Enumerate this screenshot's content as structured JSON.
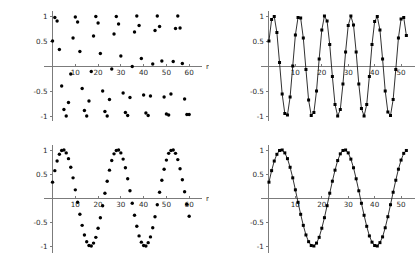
{
  "figure": {
    "name": "sampled-sinusoid-panels",
    "background_color": "#ffffff",
    "axis_color": "#7b7b7b",
    "marker_color": "#000000",
    "line_color": "#1a1a1a",
    "panel_count": 4
  },
  "chart_data": [
    {
      "id": "top-left",
      "type": "scatter",
      "title": "",
      "xlabel": "n",
      "ylabel": "",
      "xlim": [
        -2,
        63
      ],
      "ylim": [
        -1.05,
        1.05
      ],
      "grid": false,
      "legend": null,
      "xticks": [
        10,
        20,
        30,
        40,
        50,
        60
      ],
      "xticklabels": [
        "10",
        "20",
        "30",
        "40",
        "50",
        "60"
      ],
      "yticks": [
        1,
        0.5,
        -0.5,
        -1
      ],
      "yticklabels": [
        "1",
        "0.5",
        "-0.5",
        "-1"
      ],
      "series": [
        {
          "name": "x1[n]",
          "marker": "dot",
          "connected": false,
          "x": [
            0,
            1,
            2,
            3,
            4,
            5,
            6,
            7,
            8,
            9,
            10,
            11,
            12,
            13,
            14,
            15,
            16,
            17,
            18,
            19,
            20,
            21,
            22,
            23,
            24,
            25,
            26,
            27,
            28,
            29,
            30,
            31,
            32,
            33,
            34,
            35,
            36,
            37,
            38,
            39,
            40,
            41,
            42,
            43,
            44,
            45,
            46,
            47,
            48,
            49,
            50,
            51,
            52,
            53,
            54,
            55,
            56,
            57,
            58,
            59,
            60
          ],
          "y": [
            0.5,
            0.97,
            0.9,
            0.33,
            -0.4,
            -0.87,
            -1.0,
            -0.73,
            -0.16,
            0.56,
            0.98,
            0.88,
            0.29,
            -0.45,
            -0.89,
            -1.0,
            -0.7,
            -0.11,
            0.6,
            0.99,
            0.86,
            0.25,
            -0.5,
            -0.91,
            -1.0,
            -0.67,
            -0.06,
            0.64,
            0.99,
            0.84,
            0.2,
            -0.54,
            -0.93,
            -0.99,
            -0.63,
            -0.01,
            0.68,
            1.0,
            0.81,
            0.15,
            -0.58,
            -0.94,
            -0.99,
            -0.6,
            0.04,
            0.71,
            1.0,
            0.79,
            0.1,
            -0.62,
            -0.96,
            -0.98,
            -0.56,
            0.09,
            0.75,
            1.0,
            0.76,
            0.05,
            -0.66,
            -0.97,
            -0.97
          ]
        }
      ]
    },
    {
      "id": "top-right",
      "type": "line",
      "title": "",
      "xlabel": "",
      "ylabel": "",
      "xlim": [
        -1.5,
        53
      ],
      "ylim": [
        -1.05,
        1.05
      ],
      "grid": false,
      "legend": null,
      "xticks": [
        10,
        20,
        30,
        40,
        50
      ],
      "xticklabels": [
        "10",
        "20",
        "30",
        "40",
        "50"
      ],
      "yticks": [
        1,
        0.5,
        -0.5,
        -1
      ],
      "yticklabels": [
        "1",
        "0.5",
        "-0.5",
        "-1"
      ],
      "series": [
        {
          "name": "x2[n]",
          "marker": "square",
          "connected": true,
          "x": [
            0,
            1,
            2,
            3,
            4,
            5,
            6,
            7,
            8,
            9,
            10,
            11,
            12,
            13,
            14,
            15,
            16,
            17,
            18,
            19,
            20,
            21,
            22,
            23,
            24,
            25,
            26,
            27,
            28,
            29,
            30,
            31,
            32,
            33,
            34,
            35,
            36,
            37,
            38,
            39,
            40,
            41,
            42,
            43,
            44,
            45,
            46,
            47,
            48,
            49,
            50,
            51,
            52
          ],
          "y": [
            0.5,
            0.93,
            0.99,
            0.67,
            0.07,
            -0.56,
            -0.95,
            -0.98,
            -0.62,
            0.0,
            0.62,
            0.97,
            0.96,
            0.56,
            -0.07,
            -0.68,
            -0.99,
            -0.93,
            -0.5,
            0.14,
            0.72,
            1.0,
            0.9,
            0.43,
            -0.21,
            -0.77,
            -1.0,
            -0.87,
            -0.36,
            0.28,
            0.81,
            1.0,
            0.82,
            0.28,
            -0.36,
            -0.85,
            -1.0,
            -0.77,
            -0.21,
            0.43,
            0.89,
            0.99,
            0.72,
            0.14,
            -0.5,
            -0.92,
            -0.99,
            -0.67,
            -0.07,
            0.56,
            0.94,
            0.97,
            0.61
          ]
        }
      ]
    },
    {
      "id": "bottom-left",
      "type": "scatter",
      "title": "",
      "xlabel": "n",
      "ylabel": "",
      "xlim": [
        -2,
        63
      ],
      "ylim": [
        -1.05,
        1.05
      ],
      "grid": false,
      "legend": null,
      "xticks": [
        10,
        20,
        30,
        40,
        50,
        60
      ],
      "xticklabels": [
        "10",
        "20",
        "30",
        "40",
        "50",
        "60"
      ],
      "yticks": [
        1,
        0.5,
        -0.5,
        -1
      ],
      "yticklabels": [
        "1",
        "0.5",
        "-0.5",
        "-1"
      ],
      "series": [
        {
          "name": "x3[n]",
          "marker": "dot",
          "connected": false,
          "x": [
            0,
            1,
            2,
            3,
            4,
            5,
            6,
            7,
            8,
            9,
            10,
            11,
            12,
            13,
            14,
            15,
            16,
            17,
            18,
            19,
            20,
            21,
            22,
            23,
            24,
            25,
            26,
            27,
            28,
            29,
            30,
            31,
            32,
            33,
            34,
            35,
            36,
            37,
            38,
            39,
            40,
            41,
            42,
            43,
            44,
            45,
            46,
            47,
            48,
            49,
            50,
            51,
            52,
            53,
            54,
            55,
            56,
            57,
            58,
            59,
            60
          ],
          "y": [
            0.33,
            0.57,
            0.77,
            0.91,
            0.99,
            1.0,
            0.94,
            0.82,
            0.64,
            0.42,
            0.17,
            -0.09,
            -0.34,
            -0.57,
            -0.77,
            -0.91,
            -0.99,
            -1.0,
            -0.94,
            -0.82,
            -0.63,
            -0.41,
            -0.16,
            0.1,
            0.35,
            0.58,
            0.78,
            0.92,
            0.99,
            1.0,
            0.94,
            0.81,
            0.63,
            0.4,
            0.15,
            -0.11,
            -0.36,
            -0.59,
            -0.79,
            -0.92,
            -0.99,
            -1.0,
            -0.93,
            -0.81,
            -0.62,
            -0.39,
            -0.14,
            0.12,
            0.37,
            0.6,
            0.79,
            0.93,
            0.99,
            1.0,
            0.93,
            0.8,
            0.61,
            0.38,
            0.13,
            -0.13,
            -0.38
          ]
        }
      ]
    },
    {
      "id": "bottom-right",
      "type": "line",
      "title": "",
      "xlabel": "",
      "ylabel": "",
      "xlim": [
        -1.5,
        53
      ],
      "ylim": [
        -1.05,
        1.05
      ],
      "grid": false,
      "legend": null,
      "xticks": [
        10,
        20,
        30,
        40,
        50
      ],
      "xticklabels": [
        "10",
        "20",
        "30",
        "40",
        "50"
      ],
      "yticks": [
        1,
        0.5,
        -0.5,
        -1
      ],
      "yticklabels": [
        "1",
        "0.5",
        "-0.5",
        "-1"
      ],
      "series": [
        {
          "name": "x4[n]",
          "marker": "square",
          "connected": true,
          "x": [
            0,
            1,
            2,
            3,
            4,
            5,
            6,
            7,
            8,
            9,
            10,
            11,
            12,
            13,
            14,
            15,
            16,
            17,
            18,
            19,
            20,
            21,
            22,
            23,
            24,
            25,
            26,
            27,
            28,
            29,
            30,
            31,
            32,
            33,
            34,
            35,
            36,
            37,
            38,
            39,
            40,
            41,
            42,
            43,
            44,
            45,
            46,
            47,
            48,
            49,
            50,
            51,
            52
          ],
          "y": [
            0.33,
            0.57,
            0.77,
            0.91,
            0.99,
            1.0,
            0.94,
            0.82,
            0.64,
            0.42,
            0.17,
            -0.09,
            -0.34,
            -0.57,
            -0.77,
            -0.91,
            -0.99,
            -1.0,
            -0.94,
            -0.82,
            -0.63,
            -0.41,
            -0.16,
            0.1,
            0.35,
            0.58,
            0.78,
            0.92,
            0.99,
            1.0,
            0.94,
            0.81,
            0.63,
            0.4,
            0.15,
            -0.11,
            -0.36,
            -0.59,
            -0.79,
            -0.92,
            -0.99,
            -1.0,
            -0.93,
            -0.81,
            -0.62,
            -0.39,
            -0.14,
            0.12,
            0.37,
            0.6,
            0.79,
            0.93,
            0.99
          ]
        }
      ]
    }
  ]
}
